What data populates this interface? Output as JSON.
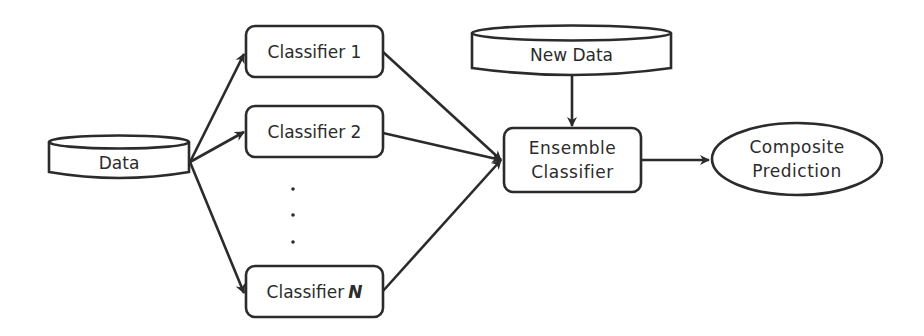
{
  "diagram": {
    "type": "ensemble-classifier-flow",
    "nodes": [
      {
        "id": "data",
        "shape": "cylinder",
        "label": "Data"
      },
      {
        "id": "classifier_1",
        "shape": "rounded-rect",
        "label": "Classifier 1"
      },
      {
        "id": "classifier_2",
        "shape": "rounded-rect",
        "label": "Classifier 2"
      },
      {
        "id": "ellipsis",
        "shape": "vertical-dots",
        "label": "⋮"
      },
      {
        "id": "classifier_n",
        "shape": "rounded-rect",
        "label_prefix": "Classifier",
        "label_suffix": "N"
      },
      {
        "id": "new_data",
        "shape": "cylinder",
        "label": "New Data"
      },
      {
        "id": "ensemble",
        "shape": "rounded-rect",
        "label_line1": "Ensemble",
        "label_line2": "Classifier"
      },
      {
        "id": "composite",
        "shape": "ellipse",
        "label_line1": "Composite",
        "label_line2": "Prediction"
      }
    ],
    "edges": [
      {
        "from": "data",
        "to": "classifier_1"
      },
      {
        "from": "data",
        "to": "classifier_2"
      },
      {
        "from": "data",
        "to": "classifier_n"
      },
      {
        "from": "classifier_1",
        "to": "ensemble"
      },
      {
        "from": "classifier_2",
        "to": "ensemble"
      },
      {
        "from": "classifier_n",
        "to": "ensemble"
      },
      {
        "from": "new_data",
        "to": "ensemble"
      },
      {
        "from": "ensemble",
        "to": "composite"
      }
    ],
    "colors": {
      "stroke": "#2b2b2b",
      "fill": "#ffffff",
      "background": "#ffffff"
    }
  },
  "labels": {
    "data": "Data",
    "classifier_1": "Classifier 1",
    "classifier_2": "Classifier 2",
    "classifier_n_prefix": "Classifier",
    "classifier_n_suffix": "N",
    "new_data": "New Data",
    "ensemble_line1": "Ensemble",
    "ensemble_line2": "Classifier",
    "composite_line1": "Composite",
    "composite_line2": "Prediction"
  }
}
